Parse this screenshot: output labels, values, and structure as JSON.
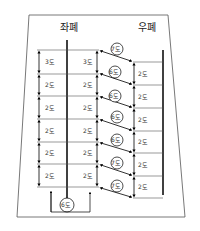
{
  "diagram": {
    "title_left": "좌폐",
    "title_right": "우폐",
    "left_column_labels": [
      "3도",
      "2도",
      "2도",
      "2도",
      "2도",
      "2도",
      "2도"
    ],
    "middle_column_labels": [
      "3도",
      "2도",
      "2도",
      "2도",
      "2도",
      "2도",
      "2도"
    ],
    "right_column_labels": [
      "2도",
      "2도",
      "2도",
      "2도",
      "2도",
      "2도",
      "2도"
    ],
    "circle_labels": [
      "7도",
      "6도",
      "6도",
      "6도",
      "6도",
      "7도",
      "7도"
    ],
    "bottom_circle_label": "6도"
  }
}
